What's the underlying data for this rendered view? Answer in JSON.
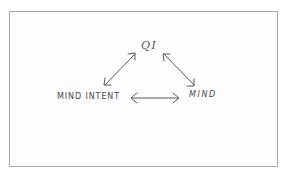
{
  "diagram": {
    "nodes": {
      "top": {
        "label": "QI"
      },
      "left": {
        "label": "MIND INTENT"
      },
      "right": {
        "label": "MIND"
      }
    },
    "edges": [
      {
        "from": "MIND INTENT",
        "to": "QI",
        "type": "bidirectional"
      },
      {
        "from": "QI",
        "to": "MIND",
        "type": "bidirectional"
      },
      {
        "from": "MIND INTENT",
        "to": "MIND",
        "type": "bidirectional"
      }
    ],
    "colors": {
      "stroke": "#555555",
      "text": "#4a4a4a",
      "border": "#a9a9a9",
      "background": "#ffffff"
    }
  }
}
